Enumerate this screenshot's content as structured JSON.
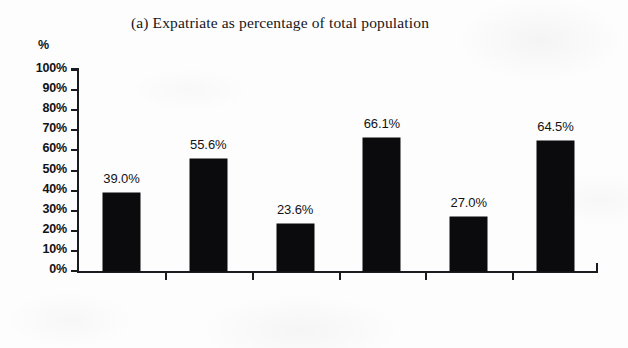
{
  "chart_data": {
    "type": "bar",
    "title": "(a) Expatriate as percentage of total population",
    "xlabel": "",
    "ylabel": "%",
    "ylim": [
      0,
      100
    ],
    "grid": false,
    "legend": null,
    "categories": [
      "Bahrain",
      "Kuwait",
      "Oman",
      "Qatar",
      "Saudi\nArabia",
      "UAE"
    ],
    "values": [
      39.0,
      55.6,
      23.6,
      66.1,
      27.0,
      64.5
    ],
    "value_labels": [
      "39.0%",
      "55.6%",
      "23.6%",
      "66.1%",
      "27.0%",
      "64.5%"
    ],
    "ytick_labels": [
      "100%",
      "90%",
      "80%",
      "70%",
      "60%",
      "50%",
      "40%",
      "30%",
      "20%",
      "10%",
      "0%"
    ],
    "ytick_values": [
      100,
      90,
      80,
      70,
      60,
      50,
      40,
      30,
      20,
      10,
      0
    ],
    "bar_color": "#0b0b0d",
    "axis_color": "#1a1b1f",
    "background_color": "#fdfdfd"
  }
}
